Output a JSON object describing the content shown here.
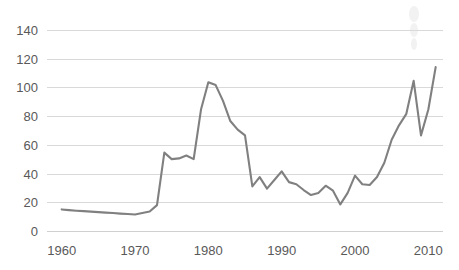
{
  "chart_data": {
    "type": "line",
    "title": "",
    "subtitle": "",
    "xlabel": "",
    "ylabel": "",
    "xlim": [
      1958,
      2012
    ],
    "ylim": [
      0,
      145
    ],
    "grid": true,
    "legend": false,
    "legend_position": "none",
    "line_color": "#808080",
    "grid_color": "#d9d9d9",
    "tick_color": "#595959",
    "xticks": [
      "1960",
      "1970",
      "1980",
      "1990",
      "2000",
      "2010"
    ],
    "xtick_values": [
      1960,
      1970,
      1980,
      1990,
      2000,
      2010
    ],
    "yticks": [
      "0",
      "20",
      "40",
      "60",
      "80",
      "100",
      "120",
      "140"
    ],
    "ytick_values": [
      0,
      20,
      40,
      60,
      80,
      100,
      120,
      140
    ],
    "series": [
      {
        "name": "price",
        "x": [
          1960,
          1961,
          1962,
          1963,
          1964,
          1965,
          1966,
          1967,
          1968,
          1969,
          1970,
          1971,
          1972,
          1973,
          1974,
          1975,
          1976,
          1977,
          1978,
          1979,
          1980,
          1981,
          1982,
          1983,
          1984,
          1985,
          1986,
          1987,
          1988,
          1989,
          1990,
          1991,
          1992,
          1993,
          1994,
          1995,
          1996,
          1997,
          1998,
          1999,
          2000,
          2001,
          2002,
          2003,
          2004,
          2005,
          2006,
          2007,
          2008,
          2009,
          2010,
          2011
        ],
        "values": [
          15.5,
          15.0,
          14.6,
          14.3,
          14.0,
          13.6,
          13.3,
          13.0,
          12.6,
          12.3,
          12.0,
          13.0,
          14.0,
          18.5,
          55.0,
          50.5,
          51.0,
          53.0,
          50.5,
          85.0,
          104.0,
          102.0,
          91.0,
          77.0,
          71.0,
          67.0,
          31.5,
          38.0,
          30.0,
          36.0,
          42.0,
          34.5,
          33.0,
          29.0,
          25.5,
          27.0,
          32.0,
          28.5,
          19.0,
          27.0,
          39.0,
          33.0,
          32.5,
          38.0,
          48.0,
          64.0,
          74.0,
          82.0,
          105.0,
          67.0,
          85.0,
          114.5
        ]
      }
    ]
  },
  "axes": {
    "y_axis_name": "value-axis",
    "x_axis_name": "year-axis"
  }
}
